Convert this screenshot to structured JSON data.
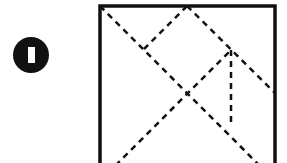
{
  "figure": {
    "type": "tangram-puzzle",
    "badge": {
      "number": "1",
      "shape": "filled-circle",
      "cx": 31,
      "cy": 55,
      "r": 18,
      "fill": "#111111",
      "glyph": {
        "x": 28,
        "y": 47,
        "w": 7,
        "h": 16,
        "fill": "#ffffff"
      }
    },
    "square": {
      "x": 100,
      "y": 6,
      "w": 175,
      "h": 175,
      "stroke": "#111111",
      "stroke_width": 3.5
    },
    "dashed_lines": [
      {
        "name": "main-diagonal",
        "x1": 100,
        "y1": 6,
        "x2": 275,
        "y2": 181
      },
      {
        "name": "anti-diagonal",
        "x1": 100,
        "y1": 181,
        "x2": 231,
        "y2": 50
      },
      {
        "name": "top-mid-to-diagonal",
        "x1": 187,
        "y1": 6,
        "x2": 144,
        "y2": 49
      },
      {
        "name": "top-mid-to-right-mid",
        "x1": 187,
        "y1": 6,
        "x2": 275,
        "y2": 93
      },
      {
        "name": "vertical-inner",
        "x1": 231,
        "y1": 50,
        "x2": 231,
        "y2": 124
      }
    ],
    "dash_style": {
      "stroke": "#111111",
      "stroke_width": 2.5,
      "dash": "6 5"
    }
  }
}
